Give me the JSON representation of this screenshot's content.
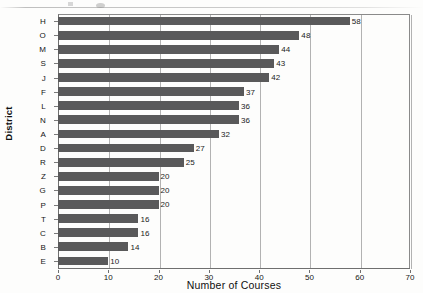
{
  "chart_data": {
    "type": "bar",
    "orientation": "horizontal",
    "title": "",
    "xlabel": "Number of Courses",
    "ylabel": "District",
    "categories": [
      "H",
      "O",
      "M",
      "S",
      "J",
      "F",
      "L",
      "N",
      "A",
      "D",
      "R",
      "Z",
      "G",
      "P",
      "T",
      "C",
      "B",
      "E"
    ],
    "values": [
      58,
      48,
      44,
      43,
      42,
      37,
      36,
      36,
      32,
      27,
      25,
      20,
      20,
      20,
      16,
      16,
      14,
      10
    ],
    "xlim": [
      0,
      70
    ],
    "xticks": [
      0,
      10,
      20,
      30,
      40,
      50,
      60,
      70
    ],
    "xtick_labels": [
      "0",
      "10",
      "20",
      "30",
      "40",
      "50",
      "60",
      "70"
    ],
    "grid": "vertical",
    "legend": "none",
    "bar_color": "#59595a",
    "data_labels": true,
    "data_label_values": [
      "58",
      "48",
      "44",
      "43",
      "42",
      "37",
      "36",
      "36",
      "32",
      "27",
      "25",
      "20",
      "20",
      "20",
      "16",
      "16",
      "14",
      "10"
    ]
  }
}
